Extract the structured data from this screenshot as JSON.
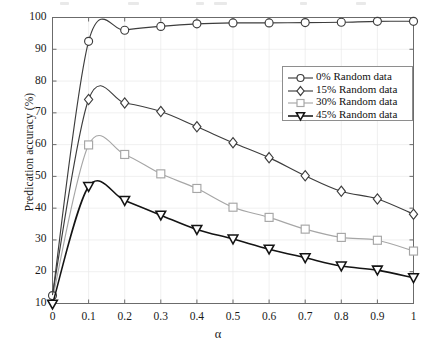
{
  "figure": {
    "ylabel": "Predication accuracy (%)",
    "xlabel": "α",
    "yticks": [
      "10",
      "20",
      "30",
      "40",
      "50",
      "60",
      "70",
      "80",
      "90",
      "100"
    ],
    "xticks": [
      "0",
      "0.1",
      "0.2",
      "0.3",
      "0.4",
      "0.5",
      "0.6",
      "0.7",
      "0.8",
      "0.9",
      "1"
    ]
  },
  "legend": {
    "items": [
      {
        "label": "0% Random data",
        "marker": "circle-marker-icon",
        "color": "#3d3d3d"
      },
      {
        "label": "15% Random data",
        "marker": "diamond-marker-icon",
        "color": "#3d3d3d"
      },
      {
        "label": "30% Random data",
        "marker": "square-marker-icon",
        "color": "#a6a6a6"
      },
      {
        "label": "45% Random data",
        "marker": "triangle-down-marker-icon",
        "color": "#141414"
      }
    ]
  },
  "chart_data": {
    "type": "line",
    "title": "",
    "xlabel": "α",
    "ylabel": "Predication accuracy (%)",
    "xlim": [
      0,
      1
    ],
    "ylim": [
      10,
      100
    ],
    "xticks": [
      0,
      0.1,
      0.2,
      0.3,
      0.4,
      0.5,
      0.6,
      0.7,
      0.8,
      0.9,
      1
    ],
    "yticks": [
      10,
      20,
      30,
      40,
      50,
      60,
      70,
      80,
      90,
      100
    ],
    "grid": true,
    "legend_position": "upper right",
    "x": [
      0,
      0.1,
      0.2,
      0.3,
      0.4,
      0.5,
      0.6,
      0.7,
      0.8,
      0.9,
      1
    ],
    "series": [
      {
        "name": "0% Random data",
        "marker": "circle",
        "color": "#3d3d3d",
        "values": [
          12.5,
          92.5,
          96.0,
          97.2,
          98.0,
          98.3,
          98.3,
          98.4,
          98.5,
          98.8,
          98.8
        ]
      },
      {
        "name": "15% Random data",
        "marker": "diamond",
        "color": "#3d3d3d",
        "values": [
          12.8,
          74.2,
          73.1,
          70.4,
          65.6,
          60.6,
          55.9,
          50.2,
          45.3,
          42.9,
          38.1
        ]
      },
      {
        "name": "30% Random data",
        "marker": "square",
        "color": "#a6a6a6",
        "values": [
          11.5,
          59.9,
          56.9,
          50.8,
          46.2,
          40.3,
          37.1,
          33.4,
          30.8,
          29.9,
          26.5
        ]
      },
      {
        "name": "45% Random data",
        "marker": "triangle-down",
        "color": "#141414",
        "values": [
          9.8,
          46.8,
          42.4,
          37.8,
          33.3,
          30.3,
          27.1,
          24.4,
          21.8,
          20.5,
          18.1
        ]
      }
    ]
  }
}
